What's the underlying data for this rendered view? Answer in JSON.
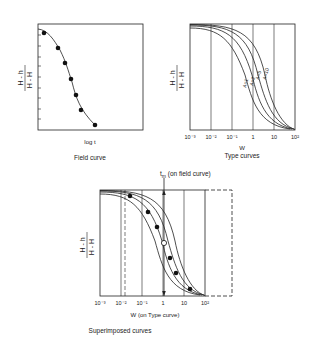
{
  "field_curve": {
    "ylabel_num": "H - h",
    "ylabel_den": "H - H",
    "ylabel_sub": "o",
    "xlabel": "log t",
    "caption": "Field curve"
  },
  "type_curves": {
    "ylabel_num": "H - h",
    "ylabel_den": "H - H",
    "ylabel_sub": "o",
    "xlabel": "W",
    "caption": "Type curves",
    "ticks": [
      "10⁻³",
      "10⁻²",
      "10⁻¹",
      "1",
      "10",
      "10²"
    ],
    "curves": [
      "A=1",
      "A=2",
      "A=5",
      "A=10"
    ]
  },
  "superimposed": {
    "annotation": "t",
    "annotation_sub": "m",
    "annotation_rest": " (on field curve)",
    "xlabel": "W (on Type curve)",
    "caption": "Superimposed curves",
    "ticks": [
      "10⁻³",
      "10⁻²",
      "10⁻¹",
      "1",
      "10",
      "10²"
    ]
  }
}
